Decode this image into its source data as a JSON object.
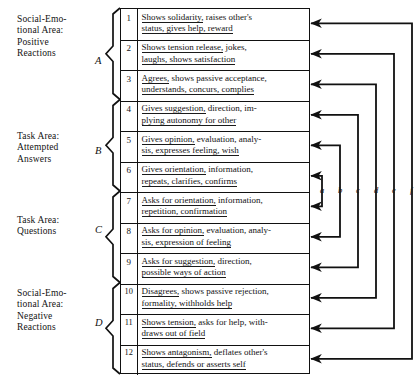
{
  "figure": {
    "type": "diagram",
    "background": "#ffffff",
    "ink": "#121212"
  },
  "areas": [
    {
      "key": "A",
      "letter": "A",
      "label": "Social-Emo-\ntional Area:\nPositive\nReactions",
      "rows": [
        1,
        2,
        3
      ]
    },
    {
      "key": "B",
      "letter": "B",
      "label": "Task Area:\nAttempted\nAnswers",
      "rows": [
        4,
        5,
        6
      ]
    },
    {
      "key": "C",
      "letter": "C",
      "label": "Task Area:\nQuestions",
      "rows": [
        7,
        8,
        9
      ]
    },
    {
      "key": "D",
      "letter": "D",
      "label": "Social-Emo-\ntional Area:\nNegative\nReactions",
      "rows": [
        10,
        11,
        12
      ]
    }
  ],
  "categories": [
    {
      "number": "1",
      "lead": "Shows solidarity,",
      "rest": " raises other's",
      "line2": "status, gives help, reward"
    },
    {
      "number": "2",
      "lead": "Shows tension release,",
      "rest": " jokes,",
      "line2": "laughs, shows satisfaction"
    },
    {
      "number": "3",
      "lead": "Agrees,",
      "rest": " shows passive acceptance,",
      "line2": "understands, concurs, complies"
    },
    {
      "number": "4",
      "lead": "Gives suggestion,",
      "rest": " direction, im-",
      "line2": "plying autonomy for other"
    },
    {
      "number": "5",
      "lead": "Gives opinion,",
      "rest": " evaluation, analy-",
      "line2": "sis, expresses feeling, wish"
    },
    {
      "number": "6",
      "lead": "Gives orientation,",
      "rest": " information,",
      "line2": "repeats, clarifies, confirms"
    },
    {
      "number": "7",
      "lead": "Asks for orientation,",
      "rest": " information,",
      "line2": "repetition, confirmation"
    },
    {
      "number": "8",
      "lead": "Asks for opinion,",
      "rest": " evaluation, analy-",
      "line2": "sis, expression of feeling"
    },
    {
      "number": "9",
      "lead": "Asks for suggestion,",
      "rest": " direction,",
      "line2": "possible ways of action"
    },
    {
      "number": "10",
      "lead": "Disagrees,",
      "rest": " shows passive rejection,",
      "line2": "formality, withholds help"
    },
    {
      "number": "11",
      "lead": "Shows tension,",
      "rest": " asks for help, with-",
      "line2": "draws out of field"
    },
    {
      "number": "12",
      "lead": "Shows antagonism,",
      "rest": " deflates other's",
      "line2": "status, defends or asserts self"
    }
  ],
  "connectors": [
    {
      "letter": "a",
      "pairs": [
        1,
        12
      ]
    },
    {
      "letter": "b",
      "pairs": [
        2,
        11
      ]
    },
    {
      "letter": "c",
      "pairs": [
        3,
        10
      ]
    },
    {
      "letter": "d",
      "pairs": [
        4,
        9
      ]
    },
    {
      "letter": "e",
      "pairs": [
        5,
        8
      ]
    },
    {
      "letter": "f",
      "pairs": [
        6,
        7
      ]
    }
  ]
}
